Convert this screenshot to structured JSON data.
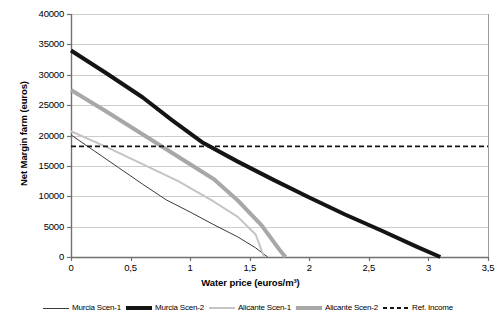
{
  "chart_data": {
    "type": "line",
    "title": "",
    "xlabel": "Water price (euros/m³)",
    "ylabel": "Net Margin farm (euros)",
    "xlim": [
      0,
      3.5
    ],
    "ylim": [
      0,
      40000
    ],
    "xticks": [
      "0",
      "0,5",
      "1",
      "1,5",
      "2",
      "2,5",
      "3",
      "3,5"
    ],
    "xtick_values": [
      0,
      0.5,
      1,
      1.5,
      2,
      2.5,
      3,
      3.5
    ],
    "yticks": [
      "0",
      "5000",
      "10000",
      "15000",
      "20000",
      "25000",
      "30000",
      "35000",
      "40000"
    ],
    "ytick_values": [
      0,
      5000,
      10000,
      15000,
      20000,
      25000,
      30000,
      35000,
      40000
    ],
    "grid": "horizontal",
    "legend_position": "bottom",
    "series": [
      {
        "name": "Murcia Scen-1",
        "color": "#3a3a3a",
        "width": 1,
        "dash": "none",
        "points": [
          [
            0.0,
            20100
          ],
          [
            0.2,
            17400
          ],
          [
            0.4,
            14700
          ],
          [
            0.6,
            12000
          ],
          [
            0.8,
            9400
          ],
          [
            1.0,
            7400
          ],
          [
            1.2,
            5300
          ],
          [
            1.4,
            3300
          ],
          [
            1.55,
            1500
          ],
          [
            1.65,
            0
          ]
        ]
      },
      {
        "name": "Murcia Scen-2",
        "color": "#141414",
        "width": 4,
        "dash": "none",
        "points": [
          [
            0.0,
            34000
          ],
          [
            0.3,
            30200
          ],
          [
            0.6,
            26300
          ],
          [
            0.85,
            22500
          ],
          [
            1.1,
            18900
          ],
          [
            1.4,
            15700
          ],
          [
            1.7,
            12700
          ],
          [
            2.0,
            9800
          ],
          [
            2.3,
            7000
          ],
          [
            2.6,
            4400
          ],
          [
            2.9,
            1700
          ],
          [
            3.1,
            0
          ]
        ]
      },
      {
        "name": "Alicante Scen-1",
        "color": "#c4c4c4",
        "width": 2,
        "dash": "none",
        "points": [
          [
            0.0,
            20700
          ],
          [
            0.3,
            18100
          ],
          [
            0.6,
            15300
          ],
          [
            0.9,
            12500
          ],
          [
            1.2,
            9100
          ],
          [
            1.4,
            6600
          ],
          [
            1.55,
            3700
          ],
          [
            1.62,
            0
          ]
        ]
      },
      {
        "name": "Alicante Scen-2",
        "color": "#a8a8a8",
        "width": 4,
        "dash": "none",
        "points": [
          [
            0.0,
            27500
          ],
          [
            0.3,
            23900
          ],
          [
            0.6,
            20200
          ],
          [
            0.9,
            16500
          ],
          [
            1.2,
            12800
          ],
          [
            1.4,
            9300
          ],
          [
            1.6,
            5200
          ],
          [
            1.75,
            1200
          ],
          [
            1.8,
            0
          ]
        ]
      },
      {
        "name": "Ref. Income",
        "color": "#141414",
        "width": 1.8,
        "dash": "dashed",
        "points": [
          [
            0.0,
            18200
          ],
          [
            3.5,
            18200
          ]
        ]
      }
    ]
  }
}
